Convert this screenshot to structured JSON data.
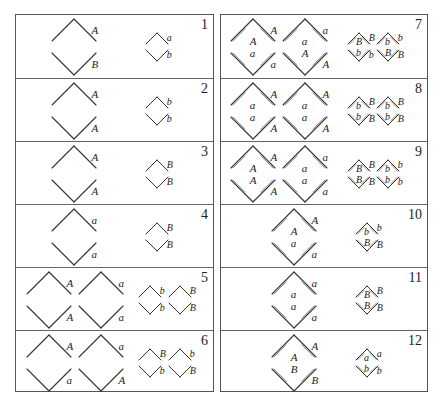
{
  "figure": {
    "left_panel": {
      "cells": [
        {
          "number": "1",
          "large": [
            {
              "top": "A",
              "bottom": "B",
              "inner": []
            }
          ],
          "small": [
            {
              "top": "a",
              "bottom": "b",
              "inner": []
            }
          ],
          "style": "single"
        },
        {
          "number": "2",
          "large": [
            {
              "top": "A",
              "bottom": "A",
              "inner": []
            }
          ],
          "small": [
            {
              "top": "b",
              "bottom": "b",
              "inner": []
            }
          ],
          "style": "single"
        },
        {
          "number": "3",
          "large": [
            {
              "top": "A",
              "bottom": "A",
              "inner": []
            }
          ],
          "small": [
            {
              "top": "B",
              "bottom": "B",
              "inner": []
            }
          ],
          "style": "single"
        },
        {
          "number": "4",
          "large": [
            {
              "top": "a",
              "bottom": "a",
              "inner": []
            }
          ],
          "small": [
            {
              "top": "B",
              "bottom": "B",
              "inner": []
            }
          ],
          "style": "single"
        },
        {
          "number": "5",
          "large": [
            {
              "top": "A",
              "bottom": "A",
              "inner": []
            },
            {
              "top": "a",
              "bottom": "a",
              "inner": []
            }
          ],
          "small": [
            {
              "top": "b",
              "bottom": "b",
              "inner": []
            },
            {
              "top": "B",
              "bottom": "B",
              "inner": []
            }
          ],
          "style": "single"
        },
        {
          "number": "6",
          "large": [
            {
              "top": "A",
              "bottom": "a",
              "inner": []
            },
            {
              "top": "a",
              "bottom": "A",
              "inner": []
            }
          ],
          "small": [
            {
              "top": "B",
              "bottom": "b",
              "inner": []
            },
            {
              "top": "b",
              "bottom": "B",
              "inner": []
            }
          ],
          "style": "single"
        }
      ]
    },
    "right_panel": {
      "cells": [
        {
          "number": "7",
          "large": [
            {
              "top": "A",
              "bottom": "a",
              "inner": [
                "A",
                "a"
              ]
            },
            {
              "top": "a",
              "bottom": "A",
              "inner": [
                "a",
                "A"
              ]
            }
          ],
          "small": [
            {
              "top": "B",
              "bottom": "b",
              "inner": [
                "B",
                "b"
              ]
            },
            {
              "top": "b",
              "bottom": "B",
              "inner": [
                "b",
                "B"
              ]
            }
          ],
          "style": "double"
        },
        {
          "number": "8",
          "large": [
            {
              "top": "A",
              "bottom": "A",
              "inner": [
                "a",
                "a"
              ]
            },
            {
              "top": "A",
              "bottom": "A",
              "inner": [
                "a",
                "a"
              ]
            }
          ],
          "small": [
            {
              "top": "B",
              "bottom": "B",
              "inner": [
                "b",
                "b"
              ]
            },
            {
              "top": "B",
              "bottom": "B",
              "inner": [
                "b",
                "b"
              ]
            }
          ],
          "style": "double"
        },
        {
          "number": "9",
          "large": [
            {
              "top": "A",
              "bottom": "A",
              "inner": [
                "A",
                "A"
              ]
            },
            {
              "top": "a",
              "bottom": "a",
              "inner": [
                "a",
                "a"
              ]
            }
          ],
          "small": [
            {
              "top": "B",
              "bottom": "B",
              "inner": [
                "B",
                "B"
              ]
            },
            {
              "top": "b",
              "bottom": "b",
              "inner": [
                "b",
                "b"
              ]
            }
          ],
          "style": "double"
        },
        {
          "number": "10",
          "large": [
            {
              "top": "A",
              "bottom": "a",
              "inner": [
                "A",
                "a"
              ]
            }
          ],
          "small": [
            {
              "top": "b",
              "bottom": "B",
              "inner": [
                "b",
                "B"
              ]
            }
          ],
          "style": "double"
        },
        {
          "number": "11",
          "large": [
            {
              "top": "a",
              "bottom": "a",
              "inner": [
                "a",
                "a"
              ]
            }
          ],
          "small": [
            {
              "top": "B",
              "bottom": "B",
              "inner": [
                "B",
                "B"
              ]
            }
          ],
          "style": "double"
        },
        {
          "number": "12",
          "large": [
            {
              "top": "A",
              "bottom": "B",
              "inner": [
                "A",
                "B"
              ]
            }
          ],
          "small": [
            {
              "top": "a",
              "bottom": "b",
              "inner": [
                "a",
                "b"
              ]
            }
          ],
          "style": "double"
        }
      ]
    }
  }
}
